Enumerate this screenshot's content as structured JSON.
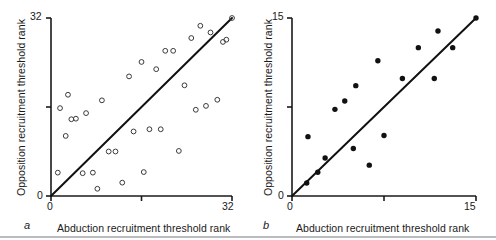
{
  "figure": {
    "panels": [
      {
        "letter": "a",
        "xlabel": "Abduction recruitment threshold rank",
        "ylabel": "Opposition recruitment threshold rank",
        "tick_x_min": "0",
        "tick_x_max": "32",
        "tick_y_min": "0",
        "tick_y_max": "32"
      },
      {
        "letter": "b",
        "xlabel": "Abduction recruitment threshold rank",
        "ylabel": "Opposition recruitment threshold rank",
        "tick_x_min": "0",
        "tick_x_max": "15",
        "tick_y_min": "0",
        "tick_y_max": "15"
      }
    ]
  },
  "chart_data": [
    {
      "type": "scatter",
      "panel": "a",
      "title": "",
      "xlabel": "Abduction recruitment threshold rank",
      "ylabel": "Opposition recruitment threshold rank",
      "xlim": [
        0,
        32
      ],
      "ylim": [
        0,
        32
      ],
      "xticks": [
        0,
        16,
        32
      ],
      "xticklabels": [
        "0",
        "",
        "32"
      ],
      "yticks": [
        0,
        16,
        32
      ],
      "yticklabels": [
        "0",
        "",
        "32"
      ],
      "grid": false,
      "legend": null,
      "marker": "open-circle",
      "marker_color": "#3a3a3a",
      "marker_fill": "none",
      "reference_line": {
        "label": "line of identity",
        "from": [
          0,
          0
        ],
        "to": [
          32,
          32
        ],
        "color": "#111111",
        "width": 2
      },
      "points": [
        [
          1.2,
          4.2
        ],
        [
          1.6,
          15.8
        ],
        [
          2.6,
          10.8
        ],
        [
          3.0,
          18.2
        ],
        [
          3.6,
          13.8
        ],
        [
          4.4,
          13.9
        ],
        [
          5.6,
          4.1
        ],
        [
          6.2,
          14.9
        ],
        [
          7.4,
          4.2
        ],
        [
          8.2,
          1.3
        ],
        [
          9.0,
          17.2
        ],
        [
          10.2,
          8.0
        ],
        [
          11.4,
          8.0
        ],
        [
          12.6,
          2.4
        ],
        [
          13.8,
          21.5
        ],
        [
          14.6,
          11.6
        ],
        [
          16.0,
          24.1
        ],
        [
          16.4,
          4.3
        ],
        [
          17.4,
          12.0
        ],
        [
          18.6,
          22.8
        ],
        [
          19.4,
          12.0
        ],
        [
          20.2,
          26.1
        ],
        [
          21.6,
          26.1
        ],
        [
          22.6,
          8.1
        ],
        [
          23.6,
          19.9
        ],
        [
          24.8,
          28.4
        ],
        [
          25.6,
          15.5
        ],
        [
          26.4,
          30.6
        ],
        [
          27.4,
          16.2
        ],
        [
          28.2,
          29.4
        ],
        [
          29.4,
          17.3
        ],
        [
          30.4,
          27.7
        ],
        [
          31.0,
          28.1
        ],
        [
          32.0,
          32.0
        ]
      ]
    },
    {
      "type": "scatter",
      "panel": "b",
      "title": "",
      "xlabel": "Abduction recruitment threshold rank",
      "ylabel": "Opposition recruitment threshold rank",
      "xlim": [
        0,
        15
      ],
      "ylim": [
        0,
        15
      ],
      "xticks": [
        0,
        7.5,
        15
      ],
      "xticklabels": [
        "0",
        "",
        "15"
      ],
      "yticks": [
        0,
        7.5,
        15
      ],
      "yticklabels": [
        "0",
        "",
        "15"
      ],
      "grid": false,
      "legend": null,
      "marker": "filled-circle",
      "marker_color": "#111111",
      "marker_fill": "#111111",
      "reference_line": {
        "label": "line of identity",
        "from": [
          0,
          0
        ],
        "to": [
          15,
          15
        ],
        "color": "#111111",
        "width": 2
      },
      "points": [
        [
          1.2,
          1.1
        ],
        [
          1.3,
          5.0
        ],
        [
          2.1,
          2.0
        ],
        [
          2.7,
          3.2
        ],
        [
          3.5,
          7.3
        ],
        [
          4.3,
          8.0
        ],
        [
          5.0,
          4.0
        ],
        [
          5.2,
          9.3
        ],
        [
          6.3,
          2.6
        ],
        [
          7.0,
          11.4
        ],
        [
          7.5,
          5.1
        ],
        [
          9.0,
          9.9
        ],
        [
          10.3,
          12.5
        ],
        [
          11.6,
          9.9
        ],
        [
          11.9,
          13.9
        ],
        [
          13.1,
          12.5
        ],
        [
          15.0,
          15.0
        ]
      ]
    }
  ]
}
